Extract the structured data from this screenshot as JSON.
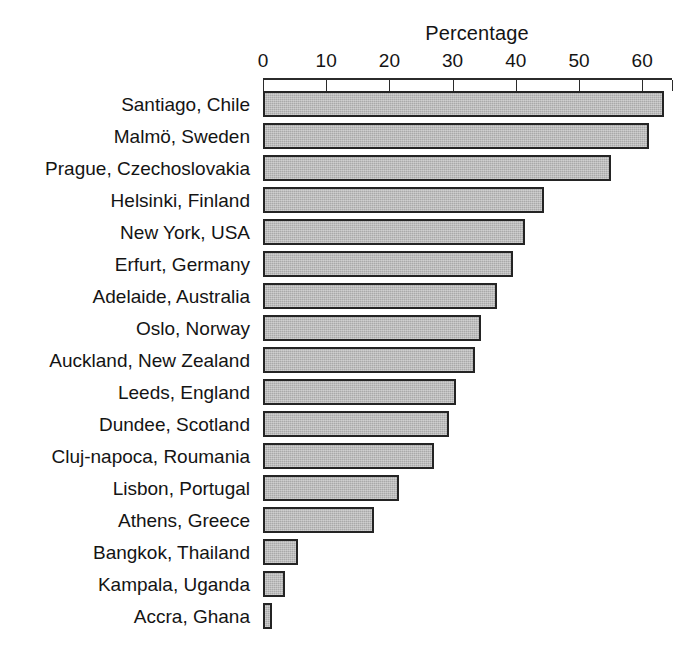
{
  "chart_data": {
    "type": "bar",
    "orientation": "horizontal",
    "title": "Percentage",
    "xlabel": "",
    "ylabel": "",
    "xlim": [
      0,
      64.7
    ],
    "grid": false,
    "legend": null,
    "xticks": [
      0,
      10,
      20,
      30,
      40,
      50,
      60
    ],
    "xtick_labels": [
      "0",
      "10",
      "20",
      "30",
      "40",
      "50",
      "60"
    ],
    "categories": [
      "Santiago, Chile",
      "Malmö, Sweden",
      "Prague, Czechoslovakia",
      "Helsinki, Finland",
      "New York, USA",
      "Erfurt, Germany",
      "Adelaide, Australia",
      "Oslo, Norway",
      "Auckland, New Zealand",
      "Leeds, England",
      "Dundee, Scotland",
      "Cluj-napoca, Roumania",
      "Lisbon, Portugal",
      "Athens, Greece",
      "Bangkok, Thailand",
      "Kampala, Uganda",
      "Accra, Ghana"
    ],
    "values": [
      63.5,
      61.0,
      55.0,
      44.5,
      41.5,
      39.5,
      37.0,
      34.5,
      33.5,
      30.5,
      29.5,
      27.0,
      21.5,
      17.5,
      5.5,
      3.5,
      1.5
    ],
    "colors": {
      "bar_fill": "#a9a9a9",
      "bar_border": "#242424",
      "axis": "#2b2b2b",
      "text": "#141414",
      "background": "#ffffff"
    }
  }
}
